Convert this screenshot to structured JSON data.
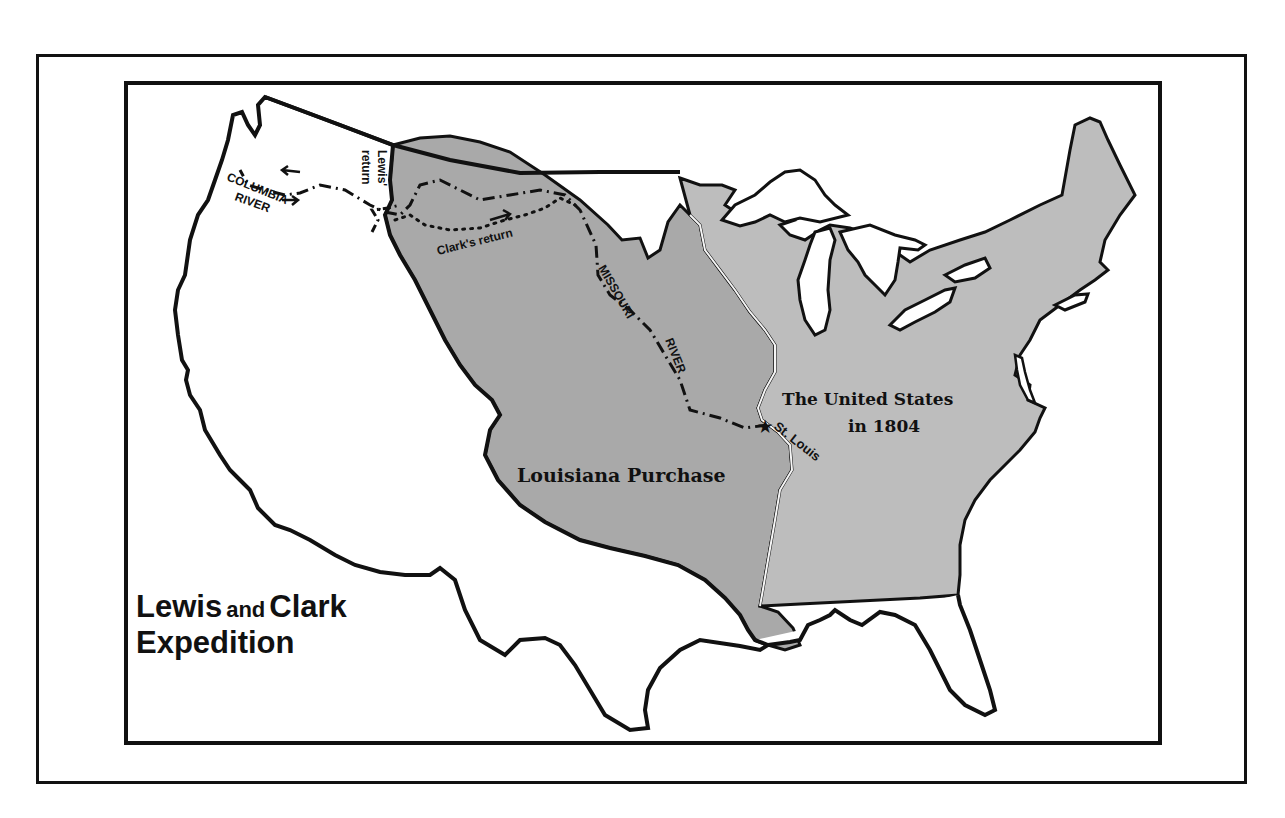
{
  "map": {
    "title": {
      "word1": "Lewis",
      "connector": "and",
      "word2": "Clark",
      "line2": "Expedition"
    },
    "regions": [
      {
        "id": "louisiana-purchase",
        "label": "Louisiana Purchase",
        "fill": "#a9a9a9"
      },
      {
        "id": "united-states-1804",
        "label_line1": "The United States",
        "label_line2": "in 1804",
        "fill": "#bdbdbd"
      }
    ],
    "labels": {
      "louisiana_purchase": "Louisiana Purchase",
      "us_line1": "The United States",
      "us_line2": "in 1804",
      "st_louis": "St. Louis",
      "missouri": "MISSOURI",
      "river": "RIVER",
      "columbia": "COLUMBIA",
      "columbia_river": "RIVER",
      "lewis": "Lewis'",
      "return": "return",
      "clarks_return": "Clark's return"
    },
    "markers": [
      {
        "id": "st-louis",
        "symbol": "★",
        "label": "St. Louis"
      }
    ],
    "routes": [
      {
        "id": "outbound-route",
        "style": "dash-dot"
      },
      {
        "id": "lewis-return",
        "style": "dash-dot"
      },
      {
        "id": "clarks-return",
        "style": "dotted"
      }
    ],
    "colors": {
      "outline": "#111111",
      "louisiana": "#a9a9a9",
      "united_states": "#bdbdbd",
      "background": "#ffffff"
    }
  }
}
